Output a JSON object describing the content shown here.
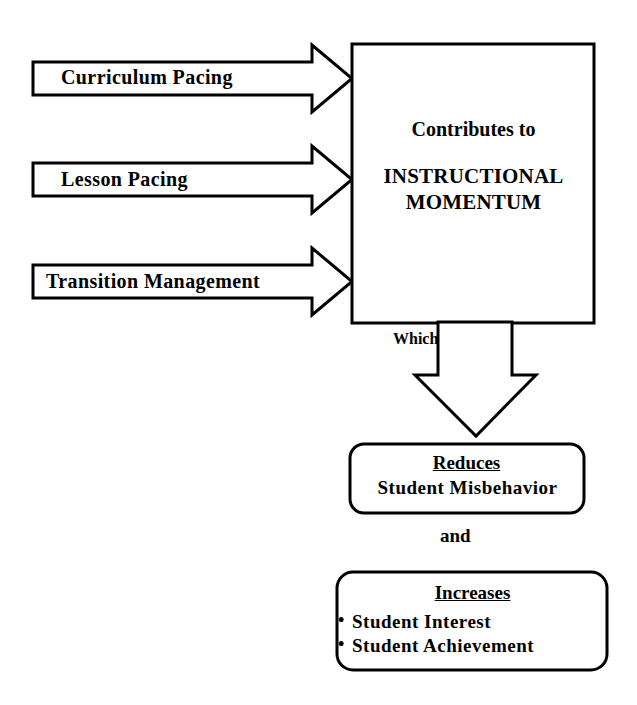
{
  "diagram": {
    "type": "flowchart",
    "background_color": "#ffffff",
    "stroke_color": "#000000",
    "inputs": [
      {
        "label": "Curriculum Pacing",
        "shape": "right-arrow"
      },
      {
        "label": "Lesson  Pacing",
        "shape": "right-arrow"
      },
      {
        "label": "Transition  Management",
        "shape": "right-arrow"
      }
    ],
    "main_box": {
      "shape": "rectangle",
      "line1": "Contributes to",
      "line2": "INSTRUCTIONAL",
      "line3": "MOMENTUM"
    },
    "connector": {
      "label": "Which",
      "shape": "down-arrow"
    },
    "outcomes": [
      {
        "shape": "rounded-rectangle",
        "heading": "Reduces",
        "heading_underlined": true,
        "body": "Student  Misbehavior",
        "items": []
      }
    ],
    "conjunction": "and",
    "outcomes2": {
      "shape": "rounded-rectangle",
      "heading": "Increases",
      "heading_underlined": true,
      "items": [
        "Student Interest",
        "Student  Achievement"
      ],
      "bullet_glyph": "•"
    }
  }
}
